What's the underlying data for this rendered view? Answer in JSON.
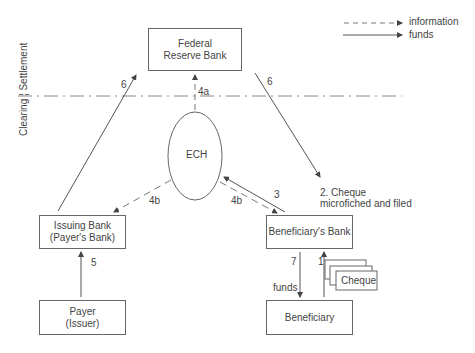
{
  "legend": {
    "items": [
      {
        "label": "information",
        "style": "dashed"
      },
      {
        "label": "funds",
        "style": "solid"
      }
    ]
  },
  "divider": {
    "left_label": "Clearing",
    "right_label": "Settlement"
  },
  "nodes": {
    "federal_reserve": {
      "line1": "Federal",
      "line2": "Reserve Bank"
    },
    "ech": {
      "label": "ECH"
    },
    "issuing_bank": {
      "line1": "Issuing Bank",
      "line2": "(Payer's Bank)"
    },
    "payer": {
      "line1": "Payer",
      "line2": "(Issuer)"
    },
    "beneficiary_bank": {
      "label": "Beneficiary's Bank"
    },
    "beneficiary": {
      "label": "Beneficiary"
    },
    "cheque": {
      "label": "Cheque"
    }
  },
  "edges": {
    "step1": "1",
    "step2_line1": "2. Cheque",
    "step2_line2": "microfiched and filed",
    "step3": "3",
    "step4a": "4a",
    "step4b_left": "4b",
    "step4b_right": "4b",
    "step5": "5",
    "step6_left": "6",
    "step6_right": "6",
    "step7": "7",
    "step7_funds": "funds"
  },
  "colors": {
    "line": "#555555",
    "text": "#444444",
    "background": "#ffffff"
  }
}
